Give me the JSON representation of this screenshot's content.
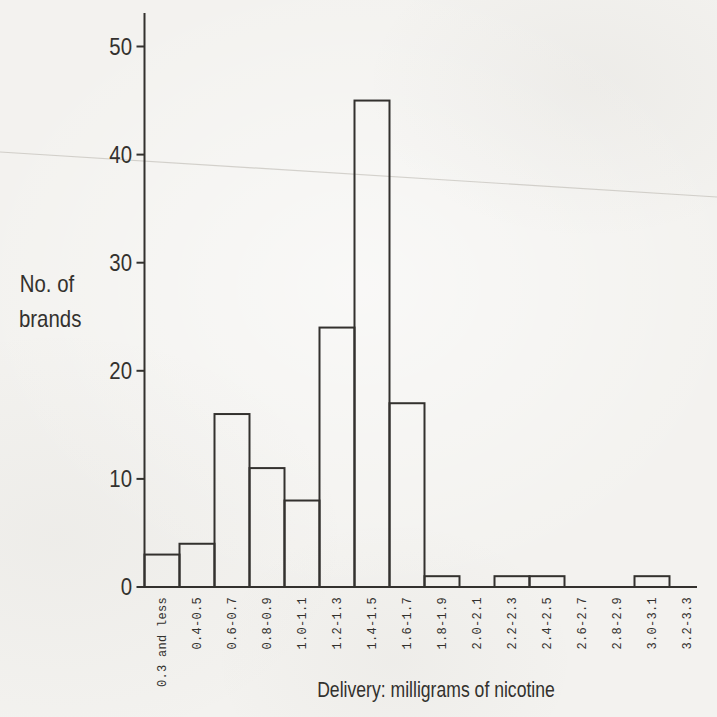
{
  "page": {
    "background_color": "#f3f2ef",
    "ink_color": "#33312e"
  },
  "chart_data": {
    "type": "bar",
    "title": "",
    "ylabel_lines": [
      "No. of",
      "brands"
    ],
    "xlabel": "Delivery: milligrams of nicotine",
    "categories": [
      "0.3 and less",
      "0.4-0.5",
      "0.6-0.7",
      "0.8-0.9",
      "1.0-1.1",
      "1.2-1.3",
      "1.4-1.5",
      "1.6-1.7",
      "1.8-1.9",
      "2.0-2.1",
      "2.2-2.3",
      "2.4-2.5",
      "2.6-2.7",
      "2.8-2.9",
      "3.0-3.1",
      "3.2-3.3"
    ],
    "values": [
      3,
      4,
      16,
      11,
      8,
      24,
      45,
      17,
      1,
      0,
      1,
      1,
      0,
      0,
      1,
      0
    ],
    "y_ticks": [
      0,
      10,
      20,
      30,
      40,
      50
    ],
    "ylim": [
      0,
      53
    ],
    "grid": false,
    "legend": false,
    "bar_style": "outline-only"
  }
}
